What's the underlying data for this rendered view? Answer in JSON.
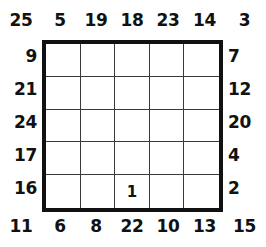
{
  "puzzle": {
    "title": "Skyscrapers grid puzzle",
    "grid_size": 5,
    "top_corner_left": "25",
    "top_corner_right": "3",
    "bottom_corner_left": "11",
    "bottom_corner_right": "15",
    "top_clues": [
      "5",
      "19",
      "18",
      "23",
      "14"
    ],
    "bottom_clues": [
      "6",
      "8",
      "22",
      "10",
      "13"
    ],
    "left_clues": [
      "9",
      "21",
      "24",
      "17",
      "16"
    ],
    "right_clues": [
      "7",
      "12",
      "20",
      "4",
      "2"
    ],
    "cells": [
      [
        "",
        "",
        "",
        "",
        ""
      ],
      [
        "",
        "",
        "",
        "",
        ""
      ],
      [
        "",
        "",
        "",
        "",
        ""
      ],
      [
        "",
        "",
        "",
        "",
        ""
      ],
      [
        "",
        "",
        "1",
        "",
        ""
      ]
    ],
    "colors": {
      "border": "#111111",
      "gridline": "#3a3a3a",
      "text": "#111111",
      "background": "#ffffff"
    }
  }
}
